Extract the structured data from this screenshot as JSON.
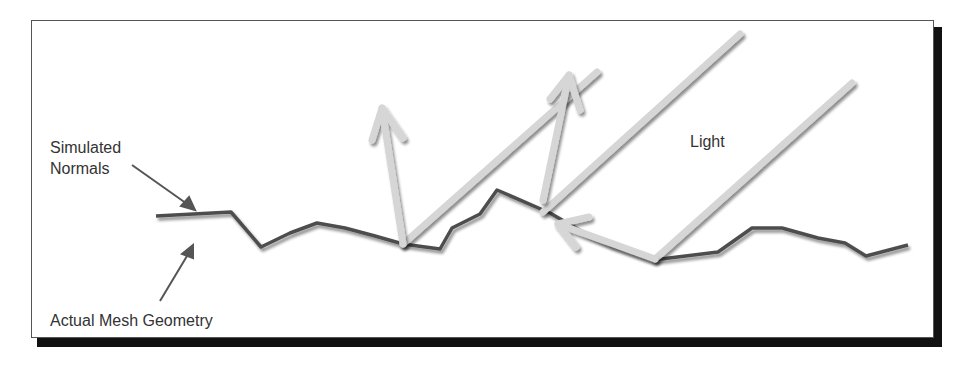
{
  "diagram": {
    "labels": {
      "simulated_normals_line1": "Simulated",
      "simulated_normals_line2": "Normals",
      "actual_mesh_geometry": "Actual Mesh Geometry",
      "light": "Light"
    },
    "colors": {
      "background": "#ffffff",
      "frame_border": "#555555",
      "frame_shadow": "#111111",
      "mesh_line": "#6e6e6e",
      "normals_line": "#4a4a4a",
      "light_ray": "#d6d6d6",
      "text": "#333333"
    }
  }
}
